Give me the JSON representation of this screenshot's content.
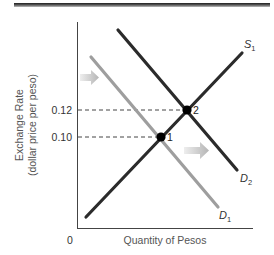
{
  "chart_data": {
    "type": "line",
    "title": "",
    "xlabel": "Quantity of Pesos",
    "ylabel_line1": "Exchange Rate",
    "ylabel_line2": "(dollar price per peso)",
    "origin_label": "0",
    "y_ticks": [
      {
        "label": "0.12",
        "value": 0.12
      },
      {
        "label": "0.10",
        "value": 0.1
      }
    ],
    "series": [
      {
        "name": "S1",
        "label_main": "S",
        "label_sub": "1",
        "role": "supply",
        "color": "#2b2b2b",
        "px": {
          "x1": 86,
          "y1": 217,
          "x2": 242,
          "y2": 53
        }
      },
      {
        "name": "D2",
        "label_main": "D",
        "label_sub": "2",
        "role": "demand-new",
        "color": "#2b2b2b",
        "px": {
          "x1": 118,
          "y1": 30,
          "x2": 237,
          "y2": 170
        }
      },
      {
        "name": "D1",
        "label_main": "D",
        "label_sub": "1",
        "role": "demand-original",
        "color": "#9e9e9e",
        "px": {
          "x1": 91,
          "y1": 57,
          "x2": 218,
          "y2": 207
        }
      }
    ],
    "equilibria": [
      {
        "label": "1",
        "exchange_rate": 0.1,
        "curves": [
          "S1",
          "D1"
        ],
        "px": {
          "x": 161,
          "y": 137
        }
      },
      {
        "label": "2",
        "exchange_rate": 0.12,
        "curves": [
          "S1",
          "D2"
        ],
        "px": {
          "x": 187,
          "y": 110
        }
      }
    ],
    "annotations": [
      {
        "type": "arrow",
        "direction": "right",
        "meaning": "demand shifts right from D1 to D2",
        "px": {
          "x": 80,
          "y": 77
        }
      },
      {
        "type": "arrow",
        "direction": "right",
        "meaning": "demand shifts right from D1 to D2",
        "px": {
          "x": 184,
          "y": 150
        }
      }
    ],
    "grid": false,
    "legend": "none (curves labeled directly)"
  },
  "colors": {
    "axis": "#444444",
    "dark_line": "#2b2b2b",
    "gray_line": "#9e9e9e",
    "arrow": "#c8c8c8",
    "top_rule": "#3a3a3a"
  }
}
